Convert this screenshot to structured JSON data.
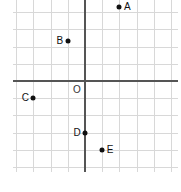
{
  "figure": {
    "kind": "coordinate-plane",
    "origin_label": "O",
    "background_color": "#ffffff",
    "grid_color": "#d8d8d8",
    "axis_color": "#555555",
    "point_color": "#111111"
  },
  "chart_data": {
    "type": "scatter",
    "title": "",
    "xlabel": "",
    "ylabel": "",
    "grid": true,
    "legend": null,
    "xlim": [
      -4.2,
      5.4
    ],
    "ylim": [
      -5.3,
      4.7
    ],
    "xticks": [
      -4,
      -3,
      -2,
      -1,
      0,
      1,
      2,
      3,
      4,
      5
    ],
    "yticks": [
      -5,
      -4,
      -3,
      -2,
      -1,
      0,
      1,
      2,
      3,
      4
    ],
    "xticklabels": [],
    "yticklabels": [],
    "origin_label": "O",
    "points": [
      {
        "label": "A",
        "x": 2,
        "y": 4.3,
        "label_side": "right"
      },
      {
        "label": "B",
        "x": -1,
        "y": 2.3,
        "label_side": "left"
      },
      {
        "label": "C",
        "x": -3,
        "y": -1,
        "label_side": "left"
      },
      {
        "label": "D",
        "x": 0,
        "y": -3,
        "label_side": "left"
      },
      {
        "label": "E",
        "x": 1,
        "y": -4,
        "label_side": "right"
      }
    ]
  }
}
